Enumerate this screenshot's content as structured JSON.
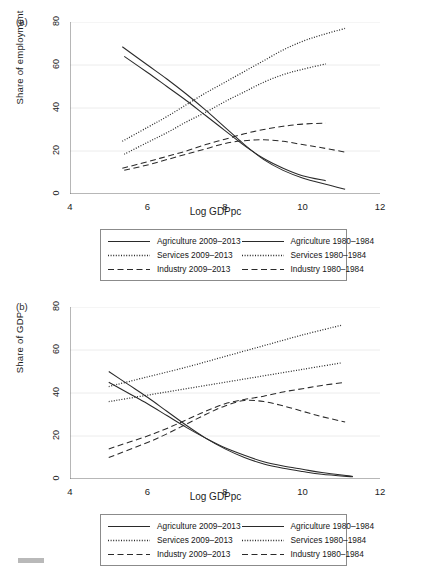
{
  "figure": {
    "panels": [
      {
        "tag": "(a)",
        "ylabel": "Share of employment",
        "xlabel": "Log GDPpc"
      },
      {
        "tag": "(b)",
        "ylabel": "Share of GDP",
        "xlabel": "Log GDPpc"
      }
    ],
    "legend": {
      "items": [
        {
          "label": "Agriculture 2009–2013",
          "style": "solid"
        },
        {
          "label": "Agriculture 1980–1984",
          "style": "solid"
        },
        {
          "label": "Services 2009–2013",
          "style": "dotted"
        },
        {
          "label": "Services 1980–1984",
          "style": "dotted"
        },
        {
          "label": "Industry 2009–2013",
          "style": "dashed"
        },
        {
          "label": "Industry 1980–1984",
          "style": "dashed"
        }
      ]
    }
  },
  "chart_data": [
    {
      "type": "line",
      "title": "(a)",
      "xlabel": "Log GDPpc",
      "ylabel": "Share of employment",
      "xlim": [
        4,
        12
      ],
      "ylim": [
        0,
        80
      ],
      "xticks": [
        4,
        6,
        8,
        10,
        12
      ],
      "yticks": [
        0,
        20,
        40,
        60,
        80
      ],
      "grid": "horizontal",
      "legend_position": "below",
      "series": [
        {
          "name": "Agriculture 2009–2013",
          "style": "solid",
          "x": [
            5.35,
            6.0,
            6.5,
            7.0,
            7.5,
            8.0,
            8.5,
            9.0,
            9.5,
            10.0,
            10.6,
            11.1
          ],
          "y": [
            68.5,
            60.0,
            53.5,
            46.5,
            39.0,
            31.0,
            23.0,
            16.0,
            11.0,
            7.5,
            4.5,
            2.2
          ]
        },
        {
          "name": "Agriculture 1980–1984",
          "style": "solid",
          "x": [
            5.4,
            6.0,
            6.5,
            7.0,
            7.5,
            8.0,
            8.5,
            9.0,
            9.5,
            10.0,
            10.6
          ],
          "y": [
            64.0,
            56.5,
            50.0,
            43.5,
            36.5,
            29.5,
            22.5,
            16.5,
            12.0,
            8.5,
            6.2
          ]
        },
        {
          "name": "Services 2009–2013",
          "style": "dotted",
          "x": [
            5.35,
            6.0,
            6.5,
            7.0,
            7.5,
            8.0,
            8.5,
            9.0,
            9.5,
            10.0,
            10.5,
            11.1
          ],
          "y": [
            24.5,
            31.0,
            36.0,
            41.5,
            47.0,
            52.0,
            57.0,
            62.0,
            67.0,
            71.0,
            74.0,
            77.0
          ]
        },
        {
          "name": "Services 1980–1984",
          "style": "dotted",
          "x": [
            5.4,
            6.0,
            6.5,
            7.0,
            7.5,
            8.0,
            8.5,
            9.0,
            9.5,
            10.0,
            10.6
          ],
          "y": [
            18.5,
            24.0,
            28.5,
            33.5,
            38.0,
            43.0,
            47.5,
            52.0,
            55.5,
            58.0,
            60.5
          ]
        },
        {
          "name": "Industry 2009–2013",
          "style": "dashed",
          "x": [
            5.35,
            6.0,
            6.5,
            7.0,
            7.5,
            8.0,
            8.5,
            9.0,
            9.5,
            10.0,
            10.6
          ],
          "y": [
            12.0,
            15.0,
            17.5,
            20.0,
            23.0,
            25.5,
            28.0,
            30.0,
            31.5,
            32.5,
            33.0
          ]
        },
        {
          "name": "Industry 1980–1984",
          "style": "dashed",
          "x": [
            5.4,
            6.0,
            6.5,
            7.0,
            7.5,
            8.0,
            8.5,
            9.0,
            9.5,
            10.0,
            10.5,
            11.1
          ],
          "y": [
            11.0,
            13.5,
            16.0,
            18.5,
            21.0,
            23.5,
            24.8,
            25.2,
            24.5,
            23.0,
            21.5,
            19.5
          ]
        }
      ]
    },
    {
      "type": "line",
      "title": "(b)",
      "xlabel": "Log GDPpc",
      "ylabel": "Share of GDP",
      "xlim": [
        4,
        12
      ],
      "ylim": [
        0,
        80
      ],
      "xticks": [
        4,
        6,
        8,
        10,
        12
      ],
      "yticks": [
        0,
        20,
        40,
        60,
        80
      ],
      "grid": "horizontal",
      "legend_position": "below",
      "series": [
        {
          "name": "Agriculture 2009–2013",
          "style": "solid",
          "x": [
            5.0,
            5.5,
            6.0,
            6.5,
            7.0,
            7.5,
            8.0,
            8.5,
            9.0,
            9.5,
            10.0,
            10.5,
            11.3
          ],
          "y": [
            50.0,
            44.0,
            38.0,
            31.5,
            25.0,
            19.0,
            14.0,
            10.0,
            7.0,
            5.0,
            3.5,
            2.2,
            1.0
          ]
        },
        {
          "name": "Agriculture 1980–1984",
          "style": "solid",
          "x": [
            5.0,
            5.5,
            6.0,
            6.5,
            7.0,
            7.5,
            8.0,
            8.5,
            9.0,
            9.5,
            10.0,
            10.5,
            11.3
          ],
          "y": [
            45.0,
            40.0,
            35.0,
            29.5,
            24.0,
            19.0,
            14.5,
            11.0,
            8.0,
            6.0,
            4.5,
            3.0,
            1.2
          ]
        },
        {
          "name": "Services 2009–2013",
          "style": "dotted",
          "x": [
            5.0,
            6.0,
            7.0,
            8.0,
            9.0,
            10.0,
            11.0
          ],
          "y": [
            43.0,
            47.5,
            52.0,
            57.0,
            62.0,
            67.0,
            71.5
          ]
        },
        {
          "name": "Services 1980–1984",
          "style": "dotted",
          "x": [
            5.0,
            6.0,
            7.0,
            8.0,
            9.0,
            10.0,
            11.0
          ],
          "y": [
            36.0,
            39.0,
            42.0,
            45.0,
            48.0,
            51.0,
            54.0
          ]
        },
        {
          "name": "Industry 2009–2013",
          "style": "dashed",
          "x": [
            5.0,
            6.0,
            6.5,
            7.0,
            7.5,
            8.0,
            8.5,
            9.0,
            9.5,
            10.0,
            10.5,
            11.1
          ],
          "y": [
            14.0,
            20.0,
            23.5,
            27.5,
            31.5,
            35.0,
            37.0,
            38.5,
            40.5,
            42.0,
            43.5,
            45.0
          ]
        },
        {
          "name": "Industry 1980–1984",
          "style": "dashed",
          "x": [
            5.0,
            6.0,
            6.5,
            7.0,
            7.5,
            8.0,
            8.5,
            9.0,
            9.5,
            10.0,
            10.5,
            11.1
          ],
          "y": [
            10.0,
            17.0,
            21.0,
            25.5,
            30.0,
            34.0,
            36.5,
            36.0,
            34.0,
            31.5,
            29.0,
            26.5
          ]
        }
      ]
    }
  ]
}
